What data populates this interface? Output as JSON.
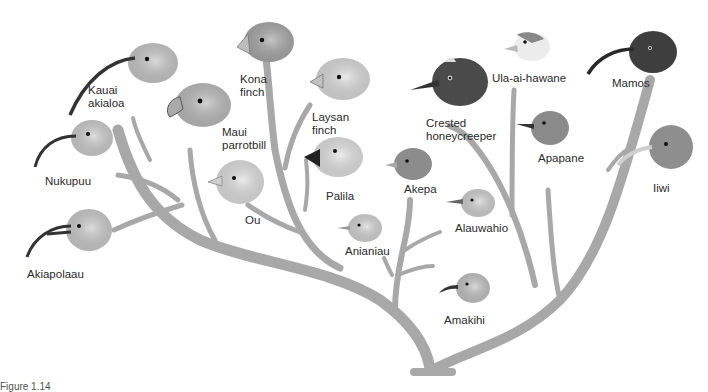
{
  "figure": {
    "caption": "Figure 1.14",
    "branch_color": "#a8a8a8",
    "branch_edge_color": "#8f8f8f"
  },
  "birds": [
    {
      "id": "kauai-akialoa",
      "label": "Kauai\nakialoa",
      "head_color": "#c9c9c9",
      "beak": "long-curved"
    },
    {
      "id": "nukupuu",
      "label": "Nukupuu",
      "head_color": "#cfcfcf",
      "beak": "curved"
    },
    {
      "id": "akiapolaau",
      "label": "Akiapolaau",
      "head_color": "#cdcdcd",
      "beak": "curved-split"
    },
    {
      "id": "kona-finch",
      "label": "Kona\nfinch",
      "head_color": "#a9a9a9",
      "beak": "heavy-finch"
    },
    {
      "id": "maui-parrotbill",
      "label": "Maui\nparrotbill",
      "head_color": "#bdbdbd",
      "beak": "parrot"
    },
    {
      "id": "ou",
      "label": "Ou",
      "head_color": "#e2e2e2",
      "beak": "hooked-short"
    },
    {
      "id": "laysan-finch",
      "label": "Laysan\nfinch",
      "head_color": "#dedede",
      "beak": "finch"
    },
    {
      "id": "palila",
      "label": "Palila",
      "head_color": "#e4e4e4",
      "beak": "dark-finch"
    },
    {
      "id": "crested-honeycreeper",
      "label": "Crested\nhoneycreeper",
      "head_color": "#4a4a4a",
      "beak": "slender"
    },
    {
      "id": "akepa",
      "label": "Akepa",
      "head_color": "#8c8c8c",
      "beak": "short"
    },
    {
      "id": "anianiau",
      "label": "Anianiau",
      "head_color": "#d6d6d6",
      "beak": "short-thin"
    },
    {
      "id": "alauwahio",
      "label": "Alauwahio",
      "head_color": "#d2d2d2",
      "beak": "thin"
    },
    {
      "id": "amakihi",
      "label": "Amakihi",
      "head_color": "#c4c4c4",
      "beak": "curved-short"
    },
    {
      "id": "ula-ai-hawane",
      "label": "Ula-ai-hawane",
      "head_color": "#ececec",
      "beak": "short-conical"
    },
    {
      "id": "apapane",
      "label": "Apapane",
      "head_color": "#8a8a8a",
      "beak": "slender"
    },
    {
      "id": "mamos",
      "label": "Mamos",
      "head_color": "#3e3e3e",
      "beak": "long-curved"
    },
    {
      "id": "iiwi",
      "label": "Iiwi",
      "head_color": "#8e8e8e",
      "beak": "long-curved-pale"
    }
  ]
}
